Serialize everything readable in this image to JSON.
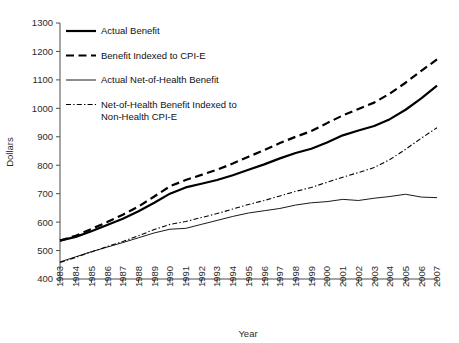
{
  "chart_data": {
    "type": "line",
    "title": "",
    "xlabel": "Year",
    "ylabel": "Dollars",
    "xlim": [
      1983,
      2007
    ],
    "ylim": [
      400,
      1300
    ],
    "ytick_step": 100,
    "grid": false,
    "legend_position": "inside-top-left",
    "x": [
      1983,
      1984,
      1985,
      1986,
      1987,
      1988,
      1989,
      1990,
      1991,
      1992,
      1993,
      1994,
      1995,
      1996,
      1997,
      1998,
      1999,
      2000,
      2001,
      2002,
      2003,
      2004,
      2005,
      2006,
      2007
    ],
    "xtick_labels": [
      "1983",
      "1984",
      "1985",
      "1986",
      "1987",
      "1988",
      "1989",
      "1990",
      "1991",
      "1992",
      "1993",
      "1994",
      "1995",
      "1996",
      "1997",
      "1998",
      "1999",
      "2000",
      "2001",
      "2002",
      "2003",
      "2004",
      "2005",
      "2006",
      "2007"
    ],
    "ytick_labels": [
      "400",
      "500",
      "600",
      "700",
      "800",
      "900",
      "1000",
      "1100",
      "1200",
      "1300"
    ],
    "series": [
      {
        "name": "Actual Benefit",
        "style": "thick-solid",
        "values": [
          535,
          548,
          568,
          590,
          612,
          638,
          668,
          700,
          722,
          735,
          748,
          765,
          784,
          803,
          824,
          843,
          858,
          880,
          905,
          922,
          938,
          962,
          995,
          1035,
          1080
        ]
      },
      {
        "name": "Benefit Indexed to CPI-E",
        "style": "thick-dashed",
        "values": [
          535,
          552,
          576,
          600,
          626,
          655,
          690,
          726,
          748,
          766,
          784,
          806,
          830,
          853,
          878,
          900,
          920,
          948,
          975,
          998,
          1020,
          1052,
          1090,
          1132,
          1172
        ]
      },
      {
        "name": "Actual Net-of-Health Benefit",
        "style": "thin-solid",
        "values": [
          460,
          478,
          496,
          512,
          528,
          545,
          562,
          575,
          578,
          592,
          606,
          620,
          632,
          640,
          648,
          660,
          668,
          672,
          680,
          676,
          684,
          690,
          698,
          688,
          686
        ]
      },
      {
        "name": "Net-of-Health Benefit Indexed to Non-Health CPI-E",
        "style": "thin-dashdot",
        "values": [
          458,
          476,
          495,
          514,
          532,
          552,
          574,
          592,
          602,
          616,
          630,
          646,
          662,
          676,
          692,
          708,
          722,
          740,
          758,
          774,
          792,
          820,
          856,
          895,
          932
        ]
      }
    ]
  },
  "legend": {
    "entries": [
      {
        "label": "Actual Benefit",
        "label2": ""
      },
      {
        "label": "Benefit Indexed to CPI-E",
        "label2": ""
      },
      {
        "label": "Actual Net-of-Health Benefit",
        "label2": ""
      },
      {
        "label": "Net-of-Health Benefit Indexed to",
        "label2": "Non-Health CPI-E"
      }
    ]
  },
  "colors": {
    "ink": "#000000",
    "axis": "#4d4d4d",
    "text": "#2b2b2b",
    "background": "#ffffff"
  }
}
